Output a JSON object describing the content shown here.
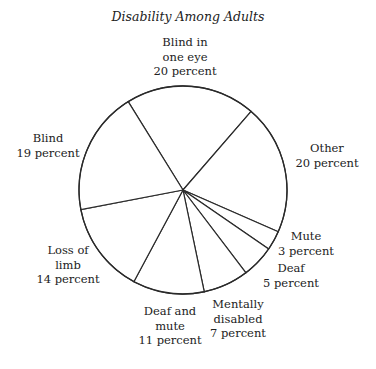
{
  "chart_data": {
    "type": "pie",
    "title": "Disability Among Adults",
    "unit": "percent",
    "start_angle_deg": 121.8,
    "direction": "clockwise",
    "slices": [
      {
        "label_lines": [
          "Blind in",
          "one eye"
        ],
        "label": "Blind in one eye",
        "value": 20,
        "value_text": "20 percent"
      },
      {
        "label_lines": [
          "Other"
        ],
        "label": "Other",
        "value": 20,
        "value_text": "20 percent"
      },
      {
        "label_lines": [
          "Mute"
        ],
        "label": "Mute",
        "value": 3,
        "value_text": "3 percent"
      },
      {
        "label_lines": [
          "Deaf"
        ],
        "label": "Deaf",
        "value": 5,
        "value_text": "5 percent"
      },
      {
        "label_lines": [
          "Mentally",
          "disabled"
        ],
        "label": "Mentally disabled",
        "value": 7,
        "value_text": "7 percent"
      },
      {
        "label_lines": [
          "Deaf and",
          "mute"
        ],
        "label": "Deaf and mute",
        "value": 11,
        "value_text": "11 percent"
      },
      {
        "label_lines": [
          "Loss of",
          "limb"
        ],
        "label": "Loss of limb",
        "value": 14,
        "value_text": "14 percent"
      },
      {
        "label_lines": [
          "Blind"
        ],
        "label": "Blind",
        "value": 19,
        "value_text": "19 percent"
      }
    ],
    "colors": {
      "line": "#2a2a2a",
      "fill": "#ffffff",
      "text": "#222222"
    },
    "legend": "none"
  }
}
